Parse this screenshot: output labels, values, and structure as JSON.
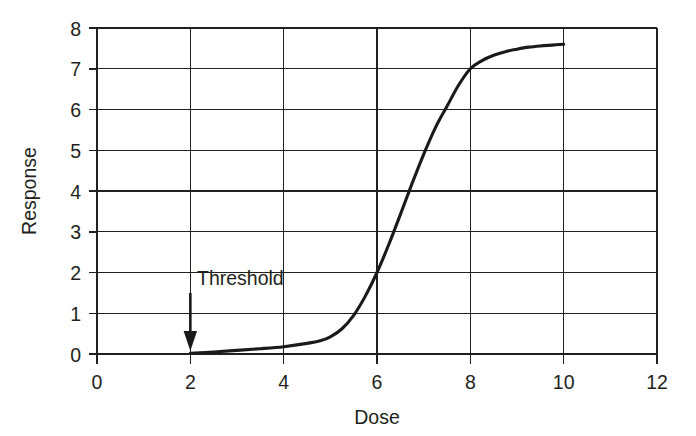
{
  "chart_data": {
    "type": "line",
    "title": "",
    "xlabel": "Dose",
    "ylabel": "Response",
    "xlim": [
      0,
      12
    ],
    "ylim": [
      0,
      8
    ],
    "xticks": [
      0,
      2,
      4,
      6,
      8,
      10,
      12
    ],
    "yticks": [
      0,
      1,
      2,
      3,
      4,
      5,
      6,
      7,
      8
    ],
    "xtick_labels": [
      "0",
      "2",
      "4",
      "6",
      "8",
      "10",
      "12"
    ],
    "ytick_labels": [
      "0",
      "1",
      "2",
      "3",
      "4",
      "5",
      "6",
      "7",
      "8"
    ],
    "grid": true,
    "legend": null,
    "line_color": "#1a1a1a",
    "grid_color": "#231f20",
    "background_color": "#ffffff",
    "series": [
      {
        "name": "Dose-response curve",
        "x": [
          2.0,
          2.5,
          3.0,
          3.5,
          4.0,
          4.5,
          4.8,
          5.0,
          5.25,
          5.5,
          5.75,
          6.0,
          6.25,
          6.5,
          6.75,
          7.0,
          7.25,
          7.5,
          7.75,
          8.0,
          8.25,
          8.5,
          8.75,
          9.0,
          9.25,
          9.5,
          9.75,
          10.0
        ],
        "y": [
          0.02,
          0.05,
          0.09,
          0.13,
          0.18,
          0.26,
          0.33,
          0.42,
          0.62,
          0.95,
          1.42,
          2.0,
          2.68,
          3.42,
          4.18,
          4.9,
          5.55,
          6.08,
          6.6,
          7.0,
          7.2,
          7.33,
          7.42,
          7.48,
          7.53,
          7.56,
          7.58,
          7.6
        ]
      }
    ],
    "annotations": [
      {
        "label": "Threshold",
        "type": "arrow-down",
        "x": 2,
        "y": 0,
        "label_x": 2.1,
        "label_y": 2.0
      }
    ]
  },
  "axes": {
    "x_title": "Dose",
    "y_title": "Response"
  },
  "annotation": {
    "threshold_label": "Threshold"
  },
  "ticks": {
    "x": [
      "0",
      "2",
      "4",
      "6",
      "8",
      "10",
      "12"
    ],
    "y": [
      "0",
      "1",
      "2",
      "3",
      "4",
      "5",
      "6",
      "7",
      "8"
    ]
  }
}
